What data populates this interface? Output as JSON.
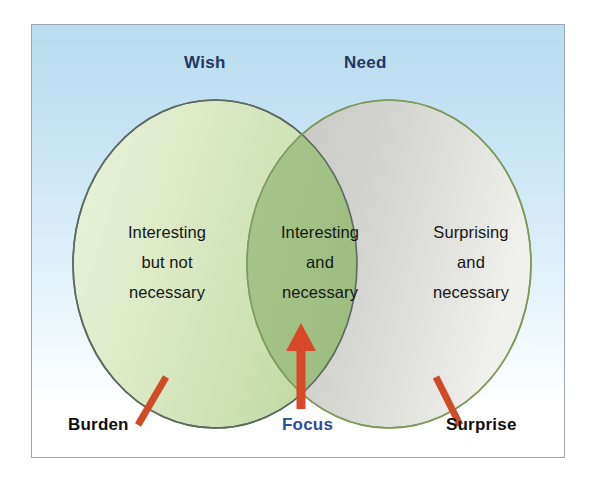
{
  "diagram": {
    "type": "venn",
    "title": "",
    "background_top_color": "#b8dcf0",
    "background_bottom_color": "#ffffff",
    "frame_border_color": "#9aa6b4",
    "sets": [
      {
        "id": "wish",
        "title": "Wish",
        "title_color": "#1f3864",
        "fill_color": "#d8e8c2",
        "stroke_color": "#5b6b63",
        "region_label": "Interesting\nbut not\nnecessary",
        "region_lines": [
          "Interesting",
          "but not",
          "necessary"
        ],
        "callout": "Burden",
        "callout_color": "#101010"
      },
      {
        "id": "need",
        "title": "Need",
        "title_color": "#1f3864",
        "fill_color": "#cfcfcb",
        "stroke_color": "#7f9a5c",
        "region_label": "Surprising\nand\nnecessary",
        "region_lines": [
          "Surprising",
          "and",
          "necessary"
        ],
        "callout": "Surprise",
        "callout_color": "#101010"
      }
    ],
    "intersection": {
      "id": "focus",
      "fill_color": "#a9c68c",
      "region_lines": [
        "Interesting",
        "and",
        "necessary"
      ],
      "callout": "Focus",
      "callout_color": "#2a4f9b",
      "arrow_color": "#d8482a"
    },
    "tick_color": "#cf4a27"
  },
  "titles": {
    "wish": "Wish",
    "need": "Need"
  },
  "regions": {
    "left": "Interesting but not necessary",
    "left_line1": "Interesting",
    "left_line2": "but not",
    "left_line3": "necessary",
    "middle": "Interesting and necessary",
    "mid_line1": "Interesting",
    "mid_line2": "and",
    "mid_line3": "necessary",
    "right": "Surprising and necessary",
    "right_line1": "Surprising",
    "right_line2": "and",
    "right_line3": "necessary"
  },
  "callouts": {
    "burden": "Burden",
    "focus": "Focus",
    "surprise": "Surprise"
  }
}
